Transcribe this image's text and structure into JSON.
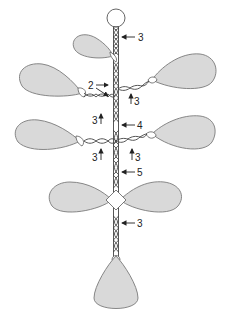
{
  "diagram": {
    "labels": {
      "top_stem": "3",
      "upper_left_junction_a": "2",
      "upper_right_branch": "3",
      "upper_left_branch": "3",
      "middle_stem": "4",
      "middle_left_branch": "3",
      "middle_right_branch": "3",
      "lower_stem": "5",
      "bottom_stem": "3"
    },
    "colors": {
      "leaf_fill": "#d9d9d9",
      "leaf_stroke": "#7a7a7a",
      "strand": "#444444",
      "background": "#ffffff"
    }
  }
}
